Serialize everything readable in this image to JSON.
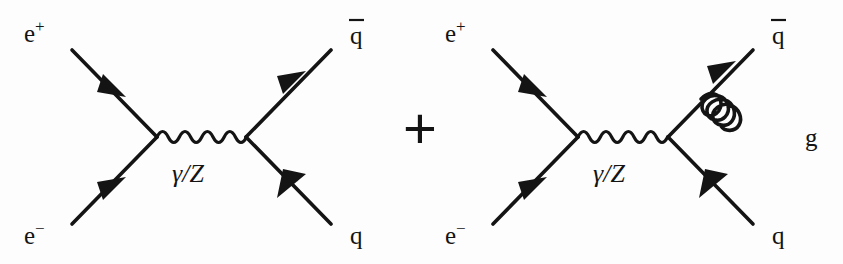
{
  "figure": {
    "background_color": "#fdfdfd",
    "ink_color": "#141414",
    "operator": "+"
  },
  "diagrams": [
    {
      "id": "tree-level",
      "name": "e+e- -> q qbar (tree level)",
      "labels": {
        "incoming_top": {
          "base": "e",
          "sup": "+"
        },
        "incoming_bottom": {
          "base": "e",
          "sup": "−"
        },
        "outgoing_top": "q̄",
        "outgoing_top_base": "q",
        "outgoing_bottom": "q",
        "propagator": "γ/Z"
      },
      "particles": [
        {
          "name": "positron",
          "label": "e+",
          "type": "fermion",
          "direction": "incoming"
        },
        {
          "name": "electron",
          "label": "e-",
          "type": "fermion",
          "direction": "incoming"
        },
        {
          "name": "photon-or-z",
          "label": "γ/Z",
          "type": "boson",
          "direction": "propagator"
        },
        {
          "name": "antiquark",
          "label": "q̄",
          "type": "fermion",
          "direction": "outgoing"
        },
        {
          "name": "quark",
          "label": "q",
          "type": "fermion",
          "direction": "outgoing"
        }
      ]
    },
    {
      "id": "gluon-emission",
      "name": "e+e- -> q qbar g (gluon bremsstrahlung)",
      "labels": {
        "incoming_top": {
          "base": "e",
          "sup": "+"
        },
        "incoming_bottom": {
          "base": "e",
          "sup": "−"
        },
        "outgoing_top": "q̄",
        "outgoing_top_base": "q",
        "outgoing_bottom": "q",
        "propagator": "γ/Z",
        "radiated": "g"
      },
      "particles": [
        {
          "name": "positron",
          "label": "e+",
          "type": "fermion",
          "direction": "incoming"
        },
        {
          "name": "electron",
          "label": "e-",
          "type": "fermion",
          "direction": "incoming"
        },
        {
          "name": "photon-or-z",
          "label": "γ/Z",
          "type": "boson",
          "direction": "propagator"
        },
        {
          "name": "antiquark",
          "label": "q̄",
          "type": "fermion",
          "direction": "outgoing"
        },
        {
          "name": "quark",
          "label": "q",
          "type": "fermion",
          "direction": "outgoing"
        },
        {
          "name": "gluon",
          "label": "g",
          "type": "gluon",
          "direction": "radiated"
        }
      ]
    }
  ]
}
